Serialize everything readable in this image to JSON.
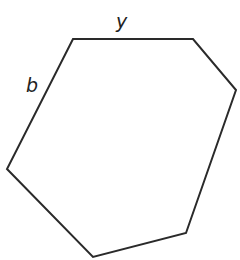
{
  "diagram": {
    "shape": "hexagon",
    "stroke_color": "#2a2a2a",
    "stroke_width": 2,
    "fill": "none",
    "vertices": [
      {
        "x": 73,
        "y": 39
      },
      {
        "x": 193,
        "y": 39
      },
      {
        "x": 236,
        "y": 90
      },
      {
        "x": 186,
        "y": 233
      },
      {
        "x": 93,
        "y": 257
      },
      {
        "x": 7,
        "y": 169
      }
    ],
    "labels": {
      "top_side": "y",
      "upper_left_side": "b"
    }
  }
}
